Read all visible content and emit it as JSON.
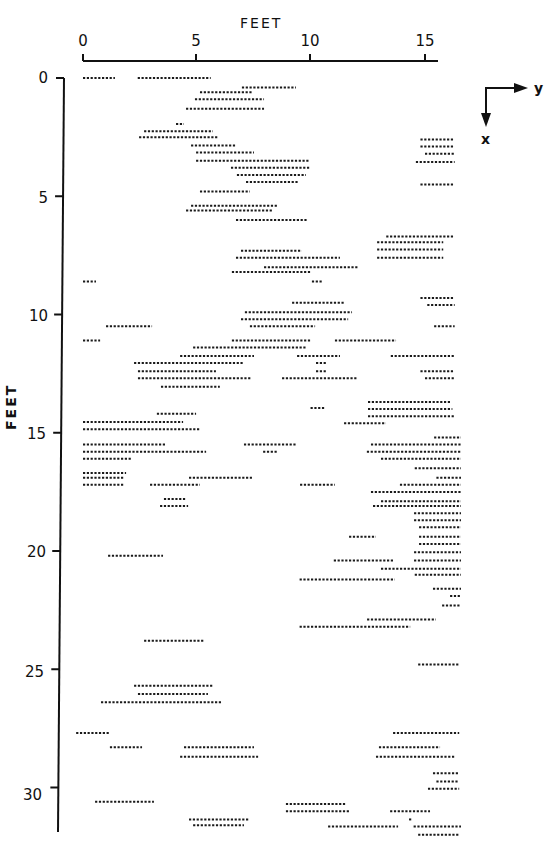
{
  "figure": {
    "top_axis_title": "FEET",
    "left_axis_title": "FEET",
    "orientation_icon": {
      "right_label": "y",
      "down_label": "x"
    }
  },
  "chart_data": {
    "type": "scatter",
    "title": "",
    "xlabel": "FEET",
    "ylabel": "FEET",
    "x_ticks": [
      "0",
      "5",
      "10",
      "15"
    ],
    "y_ticks": [
      "0",
      "5",
      "10",
      "15",
      "20",
      "25",
      "30"
    ],
    "xlim": [
      0,
      15.5
    ],
    "ylim": [
      0,
      32
    ],
    "grid": false,
    "legend": "none",
    "note": "Each segment is a horizontal dotted run at depth x (feet, downward) spanning y_start to y_end (feet, rightward).",
    "segments": [
      [
        0.0,
        0.0,
        1.4
      ],
      [
        0.0,
        2.4,
        5.6
      ],
      [
        0.4,
        6.97,
        9.34
      ],
      [
        0.6,
        5.13,
        7.41
      ],
      [
        0.9,
        4.91,
        7.94
      ],
      [
        1.3,
        4.52,
        7.94
      ],
      [
        1.95,
        4.08,
        4.43
      ],
      [
        2.25,
        2.68,
        5.7
      ],
      [
        2.5,
        2.46,
        5.92
      ],
      [
        2.85,
        4.74,
        6.71
      ],
      [
        3.15,
        4.96,
        7.5
      ],
      [
        3.5,
        4.96,
        9.96
      ],
      [
        3.8,
        6.49,
        9.96
      ],
      [
        4.1,
        6.75,
        9.78
      ],
      [
        4.4,
        7.15,
        9.43
      ],
      [
        4.8,
        5.13,
        7.32
      ],
      [
        5.4,
        4.74,
        8.55
      ],
      [
        5.6,
        4.52,
        8.29
      ],
      [
        6.0,
        6.71,
        9.82
      ],
      [
        2.6,
        14.8,
        16.3
      ],
      [
        2.9,
        14.8,
        16.3
      ],
      [
        3.2,
        15.0,
        16.3
      ],
      [
        3.55,
        14.6,
        16.3
      ],
      [
        4.5,
        14.8,
        16.3
      ],
      [
        6.7,
        13.3,
        16.3
      ],
      [
        6.95,
        12.9,
        15.8
      ],
      [
        7.25,
        12.9,
        15.8
      ],
      [
        7.6,
        12.9,
        15.8
      ],
      [
        7.3,
        6.93,
        9.6
      ],
      [
        7.6,
        6.71,
        11.27
      ],
      [
        8.0,
        7.94,
        12.06
      ],
      [
        8.2,
        6.53,
        9.96
      ],
      [
        8.6,
        0.0,
        0.57
      ],
      [
        8.6,
        10.04,
        10.48
      ],
      [
        9.3,
        14.8,
        16.3
      ],
      [
        9.5,
        9.17,
        11.45
      ],
      [
        9.6,
        15.1,
        16.3
      ],
      [
        9.9,
        7.1,
        11.8
      ],
      [
        10.2,
        6.93,
        11.63
      ],
      [
        10.5,
        1.01,
        3.03
      ],
      [
        10.5,
        7.32,
        10.18
      ],
      [
        10.5,
        15.4,
        16.3
      ],
      [
        11.1,
        0.0,
        0.75
      ],
      [
        11.1,
        6.53,
        9.96
      ],
      [
        11.1,
        11.05,
        13.73
      ],
      [
        11.4,
        4.83,
        9.78
      ],
      [
        11.75,
        4.26,
        7.5
      ],
      [
        11.75,
        9.39,
        11.27
      ],
      [
        11.75,
        13.5,
        16.3
      ],
      [
        12.05,
        2.24,
        7.06
      ],
      [
        12.05,
        10.22,
        10.66
      ],
      [
        12.4,
        2.41,
        5.83
      ],
      [
        12.4,
        10.22,
        10.66
      ],
      [
        12.4,
        14.8,
        16.3
      ],
      [
        12.7,
        2.41,
        7.41
      ],
      [
        12.7,
        8.73,
        12.06
      ],
      [
        12.7,
        15.0,
        16.3
      ],
      [
        13.05,
        3.42,
        6.0
      ],
      [
        13.7,
        12.5,
        16.1
      ],
      [
        13.95,
        9.98,
        10.63
      ],
      [
        14.0,
        12.5,
        16.2
      ],
      [
        14.3,
        12.5,
        16.3
      ],
      [
        14.6,
        11.45,
        13.29
      ],
      [
        14.2,
        3.24,
        4.96
      ],
      [
        14.55,
        0.0,
        4.39
      ],
      [
        14.85,
        0.0,
        5.13
      ],
      [
        15.2,
        15.4,
        16.6
      ],
      [
        15.5,
        0.0,
        3.64
      ],
      [
        15.5,
        7.06,
        9.34
      ],
      [
        15.5,
        12.63,
        16.6
      ],
      [
        15.8,
        0.0,
        5.4
      ],
      [
        15.8,
        7.9,
        8.5
      ],
      [
        15.8,
        12.45,
        16.6
      ],
      [
        16.1,
        0.0,
        2.15
      ],
      [
        16.1,
        13.07,
        16.6
      ],
      [
        16.5,
        14.55,
        16.6
      ],
      [
        16.7,
        0.0,
        1.89
      ],
      [
        16.9,
        0.0,
        1.8
      ],
      [
        16.9,
        4.65,
        7.41
      ],
      [
        16.9,
        15.5,
        16.6
      ],
      [
        17.2,
        0.0,
        1.8
      ],
      [
        17.2,
        2.94,
        5.13
      ],
      [
        17.2,
        13.9,
        16.6
      ],
      [
        17.2,
        9.52,
        11.05
      ],
      [
        17.5,
        12.63,
        16.6
      ],
      [
        17.8,
        3.55,
        4.52
      ],
      [
        17.9,
        13.07,
        16.6
      ],
      [
        18.1,
        3.38,
        4.61
      ],
      [
        18.1,
        12.72,
        16.6
      ],
      [
        18.4,
        14.52,
        16.6
      ],
      [
        18.7,
        14.52,
        16.6
      ],
      [
        19.0,
        14.74,
        16.6
      ],
      [
        19.4,
        11.67,
        12.85
      ],
      [
        19.4,
        14.74,
        16.6
      ],
      [
        19.7,
        14.74,
        16.6
      ],
      [
        20.05,
        14.52,
        16.6
      ],
      [
        20.2,
        1.1,
        3.51
      ],
      [
        20.4,
        11.0,
        13.64
      ],
      [
        20.4,
        14.52,
        16.6
      ],
      [
        20.75,
        13.07,
        16.6
      ],
      [
        21.0,
        14.55,
        16.6
      ],
      [
        21.2,
        9.5,
        13.68
      ],
      [
        21.6,
        15.35,
        16.6
      ],
      [
        21.9,
        16.1,
        16.6
      ],
      [
        22.3,
        15.75,
        16.6
      ],
      [
        22.9,
        12.46,
        15.48
      ],
      [
        23.2,
        9.5,
        14.35
      ],
      [
        23.8,
        2.68,
        5.31
      ],
      [
        24.8,
        14.7,
        16.5
      ],
      [
        25.7,
        2.24,
        5.7
      ],
      [
        26.05,
        2.41,
        5.48
      ],
      [
        26.4,
        0.79,
        6.09
      ],
      [
        27.7,
        13.6,
        16.5
      ],
      [
        27.7,
        -0.3,
        1.18
      ],
      [
        28.3,
        1.18,
        2.59
      ],
      [
        28.3,
        4.43,
        7.5
      ],
      [
        28.3,
        12.98,
        15.66
      ],
      [
        28.7,
        4.26,
        7.68
      ],
      [
        28.7,
        12.85,
        16.3
      ],
      [
        29.4,
        15.35,
        16.5
      ],
      [
        29.75,
        15.5,
        16.5
      ],
      [
        30.05,
        15.13,
        16.5
      ],
      [
        30.6,
        0.53,
        3.11
      ],
      [
        30.7,
        8.9,
        11.5
      ],
      [
        31.0,
        8.9,
        11.7
      ],
      [
        31.0,
        13.47,
        15.22
      ],
      [
        31.35,
        4.65,
        7.28
      ],
      [
        31.6,
        4.83,
        7.06
      ],
      [
        31.35,
        14.3,
        14.4
      ],
      [
        31.65,
        10.75,
        13.82
      ],
      [
        31.65,
        14.5,
        16.6
      ],
      [
        32.0,
        14.7,
        16.5
      ]
    ]
  }
}
